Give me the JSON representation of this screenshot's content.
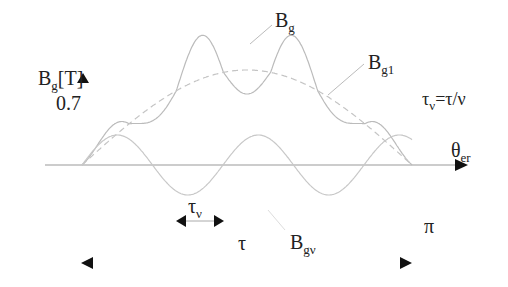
{
  "chart_data": {
    "type": "line",
    "title": "",
    "ylabel": "B_g[T]",
    "xlabel": "θ_er",
    "y_tick": "0.7",
    "x_range": [
      0,
      "π"
    ],
    "series": [
      {
        "name": "B_g",
        "description": "air-gap flux density with slot harmonic: 7 lobes, peaks rising toward center",
        "peaks_x_px": [
          105,
          148,
          195,
          245,
          295,
          340,
          386
        ]
      },
      {
        "name": "B_g1",
        "description": "fundamental (dashed half-sine)",
        "style": "dashed"
      },
      {
        "name": "B_gν",
        "description": "harmonic sinusoid about axis, period τ_ν",
        "style": "solid"
      }
    ],
    "annotations": [
      "τ_ν=τ/ν",
      "τ_ν",
      "τ",
      "π"
    ]
  },
  "labels": {
    "y_axis": "B",
    "y_axis_sub": "g",
    "y_axis_unit": "[T]",
    "y_value": "0.7",
    "bg": "B",
    "bg_sub": "g",
    "bg1": "B",
    "bg1_sub": "g1",
    "bgv": "B",
    "bgv_sub": "gν",
    "formula_a": "τ",
    "formula_a_sub": "ν",
    "formula_b": "=τ/ν",
    "tau_v": "τ",
    "tau_v_sub": "ν",
    "tau": "τ",
    "pi": "π",
    "theta": "θ",
    "theta_sub": "er"
  },
  "colors": {
    "curve": "#b8b8b8",
    "axis": "#888888",
    "text": "#222222",
    "arrow": "#111111"
  }
}
